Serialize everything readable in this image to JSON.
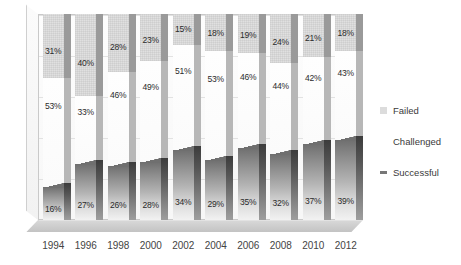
{
  "chart_data": {
    "type": "bar",
    "stacked": true,
    "title": "",
    "subtitle": "",
    "xlabel": "",
    "ylabel": "",
    "ylim": [
      0,
      100
    ],
    "grid": true,
    "legend_position": "right",
    "categories": [
      "1994",
      "1996",
      "1998",
      "2000",
      "2002",
      "2004",
      "2006",
      "2008",
      "2010",
      "2012"
    ],
    "series": [
      {
        "name": "Successful",
        "color": "#6f6f6f",
        "values": [
          16,
          27,
          26,
          28,
          34,
          29,
          35,
          32,
          37,
          39
        ],
        "labels": [
          "16%",
          "27%",
          "26%",
          "28%",
          "34%",
          "29%",
          "35%",
          "32%",
          "37%",
          "39%"
        ]
      },
      {
        "name": "Challenged",
        "color": "#fefefe",
        "values": [
          53,
          33,
          46,
          49,
          51,
          53,
          46,
          44,
          42,
          43
        ],
        "labels": [
          "53%",
          "33%",
          "46%",
          "49%",
          "51%",
          "53%",
          "46%",
          "44%",
          "42%",
          "43%"
        ]
      },
      {
        "name": "Failed",
        "color": "#e0e0e0",
        "values": [
          31,
          40,
          28,
          23,
          15,
          18,
          19,
          24,
          21,
          18
        ],
        "labels": [
          "31%",
          "40%",
          "28%",
          "23%",
          "15%",
          "18%",
          "19%",
          "24%",
          "21%",
          "18%"
        ]
      }
    ]
  },
  "axis": {
    "x_ticks": [
      "1994",
      "1996",
      "1998",
      "2000",
      "2002",
      "2004",
      "2006",
      "2008",
      "2010",
      "2012"
    ]
  },
  "legend": {
    "items": [
      {
        "label": "Failed",
        "swatch": "failed-swatch-icon"
      },
      {
        "label": "Challenged",
        "swatch": "challenged-swatch-icon"
      },
      {
        "label": "Successful",
        "swatch": "successful-swatch-icon"
      }
    ]
  }
}
